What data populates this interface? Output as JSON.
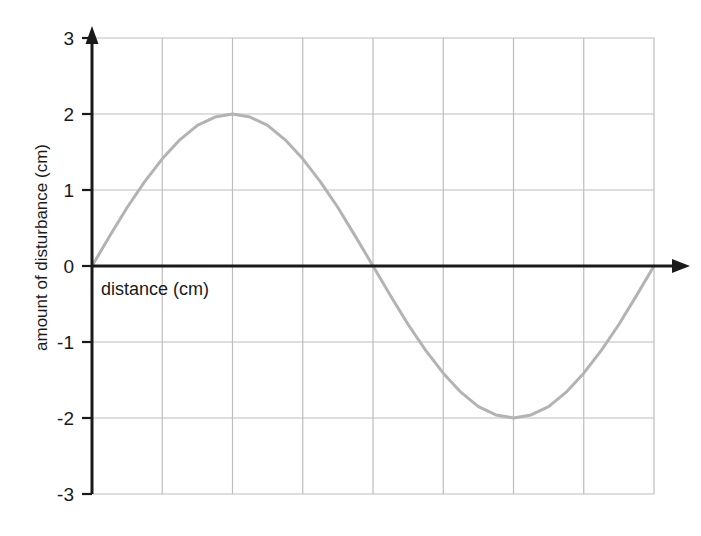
{
  "chart_data": {
    "type": "line",
    "title": "",
    "subtitle": "",
    "xlabel": "distance (cm)",
    "ylabel": "amount of disturbance (cm)",
    "xlim": [
      0,
      8
    ],
    "ylim": [
      -3,
      3
    ],
    "grid": true,
    "legend": false,
    "legend_position": "none",
    "x_tick_labels": [],
    "y_tick_labels": [
      "3",
      "2",
      "1",
      "0",
      "-1",
      "-2",
      "-3"
    ],
    "y_ticks": [
      3,
      2,
      1,
      0,
      -1,
      -2,
      -3
    ],
    "x_gridlines": [
      0,
      1,
      2,
      3,
      4,
      5,
      6,
      7,
      8
    ],
    "annotations": [],
    "series": [
      {
        "name": "disturbance",
        "color": "#b3b3b3",
        "line_width": 3,
        "description": "one full sine period, amplitude 2 cm, wavelength 8 cm",
        "x": [
          0,
          0.25,
          0.5,
          0.75,
          1,
          1.25,
          1.5,
          1.75,
          2,
          2.25,
          2.5,
          2.75,
          3,
          3.25,
          3.5,
          3.75,
          4,
          4.25,
          4.5,
          4.75,
          5,
          5.25,
          5.5,
          5.75,
          6,
          6.25,
          6.5,
          6.75,
          7,
          7.25,
          7.5,
          7.75,
          8
        ],
        "values": [
          0,
          0.39,
          0.77,
          1.11,
          1.41,
          1.66,
          1.85,
          1.96,
          2,
          1.96,
          1.85,
          1.66,
          1.41,
          1.11,
          0.77,
          0.39,
          0,
          -0.39,
          -0.77,
          -1.11,
          -1.41,
          -1.66,
          -1.85,
          -1.96,
          -2,
          -1.96,
          -1.85,
          -1.66,
          -1.41,
          -1.11,
          -0.77,
          -0.39,
          0
        ]
      }
    ],
    "key_points": {
      "start": {
        "x": 0,
        "y": 0
      },
      "crest": {
        "x": 2,
        "y": 2
      },
      "zero_crossing": {
        "x": 4,
        "y": 0
      },
      "trough": {
        "x": 6,
        "y": -2
      },
      "end": {
        "x": 8,
        "y": 0
      }
    },
    "colors": {
      "curve": "#b3b3b3",
      "gridline": "#bdbdbd",
      "axis": "#1a1a1a",
      "background": "#ffffff",
      "tick_text": "#1a1a1a"
    }
  }
}
